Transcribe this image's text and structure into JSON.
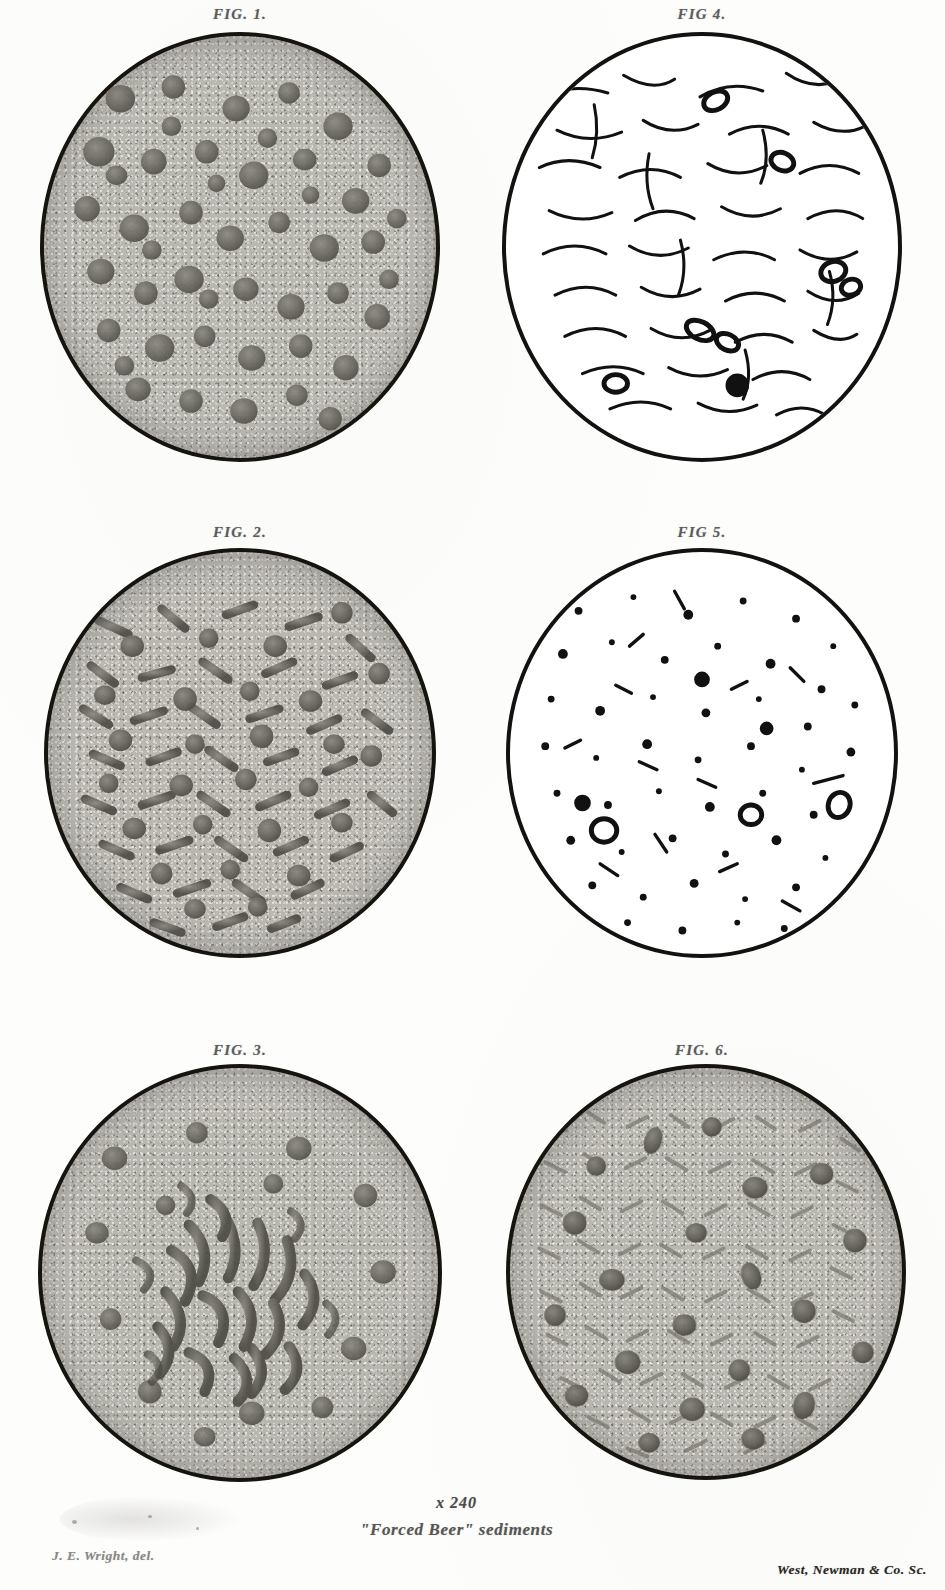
{
  "plate": {
    "kind": "lithographic-plate",
    "paper_color": "#fdfdfc",
    "ink_color": "#15140f",
    "field_color": "#b9b7b0"
  },
  "figures": [
    {
      "id": "fig-1",
      "label": "FIG. 1.",
      "style": "stipple",
      "description": "Dense field of rounded yeast cells, many in budding pairs, on a stippled grey ground"
    },
    {
      "id": "fig-2",
      "label": "FIG. 2.",
      "style": "stipple",
      "description": "Mixed field of short rods and round yeast cells on a stippled grey ground"
    },
    {
      "id": "fig-3",
      "label": "FIG. 3.",
      "style": "stipple",
      "description": "Central tangled clump of filaments and rods with scattered round cells"
    },
    {
      "id": "fig-4",
      "label": "FIG 4.",
      "style": "line",
      "description": "White field with slender curved bacterial rods and a few dark ringed yeast cells"
    },
    {
      "id": "fig-5",
      "label": "FIG 5.",
      "style": "line",
      "description": "White field sparsely strewn with small dark dots, short rods and ringed cells"
    },
    {
      "id": "fig-6",
      "label": "FIG. 6.",
      "style": "stipple",
      "description": "Densely matted field of fine rods with larger dark yeast cells throughout"
    }
  ],
  "captions": {
    "magnification": "x 240",
    "title": "\"Forced Beer\" sediments",
    "artist_credit": "J. E. Wright, del.",
    "printer_credit": "West, Newman & Co. Sc."
  }
}
